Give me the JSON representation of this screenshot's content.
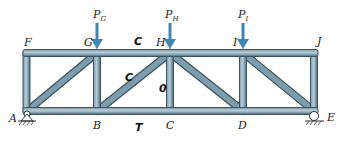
{
  "diagram": {
    "type": "truss",
    "colors": {
      "member": "#5f7f92",
      "member_edge": "#3c5566",
      "member_highlight": "#b9cdd8",
      "arrow": "#3f86b3",
      "support": "#333333"
    },
    "nodes": {
      "A": {
        "label": "A"
      },
      "B": {
        "label": "B"
      },
      "C": {
        "label": "C"
      },
      "D": {
        "label": "D"
      },
      "E": {
        "label": "E"
      },
      "F": {
        "label": "F"
      },
      "G": {
        "label": "G"
      },
      "H": {
        "label": "H"
      },
      "I": {
        "label": "I"
      },
      "J": {
        "label": "J"
      }
    },
    "loads": [
      {
        "id": "PG",
        "symbol": "P",
        "subscript": "G",
        "node": "G"
      },
      {
        "id": "PH",
        "symbol": "P",
        "subscript": "H",
        "node": "H"
      },
      {
        "id": "PI",
        "symbol": "P",
        "subscript": "I",
        "node": "I"
      }
    ],
    "member_labels": {
      "GH": "C",
      "BH": "C",
      "CH": "0",
      "BC": "T"
    },
    "supports": {
      "A": "pin",
      "E": "roller"
    }
  }
}
